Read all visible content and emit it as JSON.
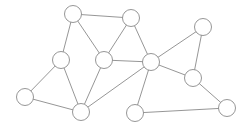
{
  "diagram": {
    "type": "undirected-graph",
    "colors": {
      "stroke": "#8a8a8a",
      "fill": "#ffffff",
      "background": "#ffffff"
    },
    "node_radius": 8.5,
    "nodes": [
      {
        "id": "A",
        "x": 73,
        "y": 14
      },
      {
        "id": "B",
        "x": 131,
        "y": 18
      },
      {
        "id": "C",
        "x": 61,
        "y": 60
      },
      {
        "id": "D",
        "x": 104,
        "y": 60
      },
      {
        "id": "E",
        "x": 25,
        "y": 97
      },
      {
        "id": "F",
        "x": 81,
        "y": 112
      },
      {
        "id": "G",
        "x": 203,
        "y": 27
      },
      {
        "id": "H",
        "x": 151,
        "y": 62
      },
      {
        "id": "I",
        "x": 193,
        "y": 78
      },
      {
        "id": "J",
        "x": 135,
        "y": 113
      },
      {
        "id": "K",
        "x": 227,
        "y": 108
      }
    ],
    "edges": [
      [
        "A",
        "B"
      ],
      [
        "A",
        "C"
      ],
      [
        "A",
        "D"
      ],
      [
        "B",
        "D"
      ],
      [
        "B",
        "H"
      ],
      [
        "D",
        "H"
      ],
      [
        "C",
        "E"
      ],
      [
        "C",
        "F"
      ],
      [
        "D",
        "F"
      ],
      [
        "E",
        "F"
      ],
      [
        "F",
        "H"
      ],
      [
        "H",
        "G"
      ],
      [
        "H",
        "I"
      ],
      [
        "H",
        "J"
      ],
      [
        "G",
        "I"
      ],
      [
        "I",
        "K"
      ],
      [
        "J",
        "K"
      ]
    ]
  }
}
